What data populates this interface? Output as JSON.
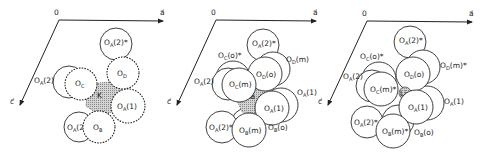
{
  "figure": {
    "colors": {
      "line": "#222222",
      "fill": "#ffffff",
      "cation_hatch": "#9a9a9a"
    },
    "panels": [
      {
        "id": "K",
        "origin_label": "0",
        "axis_a_label": "a⃗",
        "axis_c_label": "c⃗",
        "cation_label": "K",
        "atoms": [
          {
            "main": "O",
            "sub": "A",
            "suffix": "(2)*"
          },
          {
            "main": "O",
            "sub": "D",
            "suffix": ""
          },
          {
            "main": "O",
            "sub": "A",
            "suffix": "(2)"
          },
          {
            "main": "O",
            "sub": "C",
            "suffix": ""
          },
          {
            "main": "O",
            "sub": "A",
            "suffix": "(1)"
          },
          {
            "main": "O",
            "sub": "A",
            "suffix": "(2)"
          },
          {
            "main": "O",
            "sub": "B",
            "suffix": ""
          }
        ]
      },
      {
        "id": "Na",
        "origin_label": "0",
        "axis_a_label": "a⃗",
        "axis_c_label": "c⃗",
        "cation_label": "Na",
        "atoms": [
          {
            "main": "O",
            "sub": "A",
            "suffix": "(2)*"
          },
          {
            "main": "O",
            "sub": "D",
            "suffix": "(m)"
          },
          {
            "main": "O",
            "sub": "D",
            "suffix": "(o)"
          },
          {
            "main": "O",
            "sub": "C",
            "suffix": "(o)*"
          },
          {
            "main": "O",
            "sub": "A",
            "suffix": "(2)"
          },
          {
            "main": "O",
            "sub": "C",
            "suffix": "(m)"
          },
          {
            "main": "O",
            "sub": "A",
            "suffix": "(1)"
          },
          {
            "main": "O",
            "sub": "A",
            "suffix": "(1)"
          },
          {
            "main": "O",
            "sub": "A",
            "suffix": "(2)*"
          },
          {
            "main": "O",
            "sub": "B",
            "suffix": "(m)"
          },
          {
            "main": "O",
            "sub": "B",
            "suffix": "(o)"
          }
        ]
      },
      {
        "id": "Li",
        "origin_label": "0",
        "axis_a_label": "a⃗",
        "axis_c_label": "c⃗",
        "cation_label": "Li",
        "atoms": [
          {
            "main": "O",
            "sub": "A",
            "suffix": "(2)*"
          },
          {
            "main": "O",
            "sub": "D",
            "suffix": "(m)*"
          },
          {
            "main": "O",
            "sub": "D",
            "suffix": "(o)"
          },
          {
            "main": "O",
            "sub": "C",
            "suffix": "(o)*"
          },
          {
            "main": "O",
            "sub": "A",
            "suffix": "(2)"
          },
          {
            "main": "O",
            "sub": "C",
            "suffix": "(m)*"
          },
          {
            "main": "O",
            "sub": "A",
            "suffix": "(1)"
          },
          {
            "main": "O",
            "sub": "A",
            "suffix": "(1)"
          },
          {
            "main": "O",
            "sub": "A",
            "suffix": "(2)*"
          },
          {
            "main": "O",
            "sub": "B",
            "suffix": "(m)*"
          },
          {
            "main": "O",
            "sub": "B",
            "suffix": "(o)"
          }
        ]
      }
    ]
  }
}
